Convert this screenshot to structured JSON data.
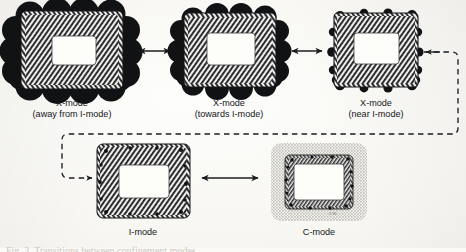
{
  "figure": {
    "title_caption": "Fig. 3.  Transitions between confinement modes",
    "artist_mark": "J.W.",
    "panels": [
      {
        "id": "x-mode-away",
        "label_line1": "X-mode",
        "label_line2": "(away from I-mode)",
        "texture": "hatched-annulus",
        "blob_size": "large",
        "blob_count": 16,
        "halo": "none"
      },
      {
        "id": "x-mode-towards",
        "label_line1": "X-mode",
        "label_line2": "(towards I-mode)",
        "texture": "hatched-annulus",
        "blob_size": "medium",
        "blob_count": 16,
        "halo": "none"
      },
      {
        "id": "x-mode-near",
        "label_line1": "X-mode",
        "label_line2": "(near I-mode)",
        "texture": "hatched-annulus",
        "blob_size": "small",
        "blob_count": 16,
        "halo": "none"
      },
      {
        "id": "i-mode",
        "label_line1": "I-mode",
        "label_line2": "",
        "texture": "hatched-annulus",
        "blob_size": "tiny",
        "blob_count": 14,
        "halo": "none"
      },
      {
        "id": "c-mode",
        "label_line1": "C-mode",
        "label_line2": "",
        "texture": "thin-hatched-ring",
        "blob_size": "tiny",
        "blob_count": 14,
        "halo": "stippled"
      }
    ],
    "connectors": [
      {
        "id": "arrow-x1-x2",
        "type": "double-arrow",
        "style": "solid"
      },
      {
        "id": "arrow-x2-x3",
        "type": "double-arrow",
        "style": "solid"
      },
      {
        "id": "arrow-i-c",
        "type": "double-arrow",
        "style": "solid"
      },
      {
        "id": "feedback-loop",
        "type": "single-arrow-both-ends",
        "style": "dashed"
      }
    ],
    "colors": {
      "ink": "#15161a",
      "blob": "#111214",
      "hatch": "#2a2b30",
      "paper": "#fbfaf7",
      "halo": "#b9b8b4"
    }
  }
}
